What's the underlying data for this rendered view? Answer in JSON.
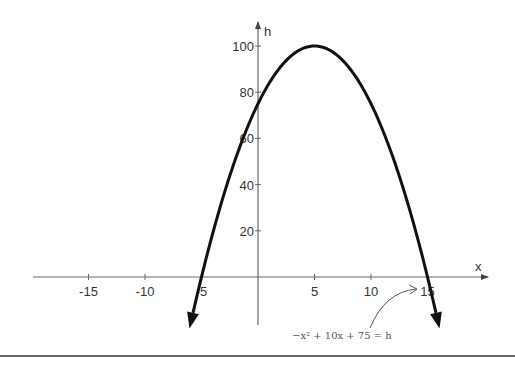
{
  "chart_data": {
    "type": "line",
    "title": "",
    "equation": "-x² + 10x + 75 = h",
    "xlabel": "x",
    "ylabel": "h",
    "x_ticks": [
      -15,
      -10,
      -5,
      5,
      10,
      15
    ],
    "x_tick_labels": [
      "-15",
      "-10",
      "-5",
      "5",
      "10",
      "15"
    ],
    "y_ticks": [
      20,
      40,
      60,
      80,
      100
    ],
    "y_tick_labels": [
      "20",
      "40",
      "60",
      "80",
      "100"
    ],
    "xlim": [
      -19.5,
      20
    ],
    "ylim": [
      -20,
      112
    ],
    "grid": false,
    "series": [
      {
        "name": "h = -x^2 + 10x + 75",
        "x": [
          -6,
          -5,
          -4,
          -2,
          0,
          2,
          4,
          5,
          6,
          8,
          10,
          12,
          14,
          15,
          16
        ],
        "values": [
          -21,
          0,
          19,
          51,
          75,
          91,
          99,
          100,
          99,
          91,
          75,
          51,
          19,
          0,
          -21
        ]
      }
    ],
    "vertex": [
      5,
      100
    ],
    "roots": [
      -5,
      15
    ],
    "y_intercept": 75
  },
  "labels": {
    "x_axis": "x",
    "y_axis": "h",
    "equation": "−x² + 10x + 75 = h"
  }
}
